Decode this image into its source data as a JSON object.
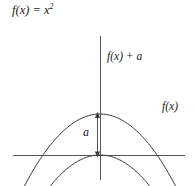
{
  "figure": {
    "title": "f(x) = x",
    "title_exponent": "2",
    "background_color": "#ffffff",
    "stroke_color": "#3c3c3c",
    "axis_color": "#555555"
  },
  "labels": {
    "shifted_curve": "f(x) + a",
    "base_curve": "f(x)",
    "offset": "a"
  },
  "axes": {
    "x_axis_name": "x-axis",
    "y_axis_name": "y-axis",
    "origin_x": 100,
    "origin_y": 155
  },
  "chart_data": {
    "type": "line",
    "xlabel": "",
    "ylabel": "",
    "grid": false,
    "legend": "inline-annotations",
    "annotations": [
      {
        "text": "f(x) + a",
        "target": "upper parabola"
      },
      {
        "text": "f(x)",
        "target": "lower parabola"
      },
      {
        "text": "a",
        "target": "vertical gap between vertices"
      }
    ],
    "series": [
      {
        "name": "f(x)",
        "expression": "x^2",
        "vertex": [
          0,
          0
        ],
        "description": "parabola with vertex on the x-axis at the origin"
      },
      {
        "name": "f(x) + a",
        "expression": "x^2 + a",
        "vertex": [
          0,
          "a"
        ],
        "description": "same parabola translated vertically upward by a"
      }
    ],
    "offset_value": "a"
  }
}
